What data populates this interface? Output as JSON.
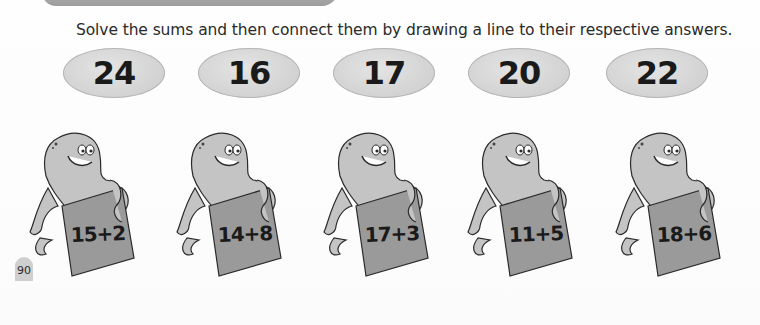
{
  "header": {
    "banner_color": "#a8a8a8"
  },
  "instruction": "Solve the sums and then connect them by drawing a line to their respective answers.",
  "answers": [
    {
      "value": "24"
    },
    {
      "value": "16"
    },
    {
      "value": "17"
    },
    {
      "value": "20"
    },
    {
      "value": "22"
    }
  ],
  "sums": [
    {
      "expression": "15+2",
      "icon": "octopus-icon"
    },
    {
      "expression": "14+8",
      "icon": "octopus-icon"
    },
    {
      "expression": "17+3",
      "icon": "octopus-icon"
    },
    {
      "expression": "11+5",
      "icon": "octopus-icon"
    },
    {
      "expression": "18+6",
      "icon": "octopus-icon"
    }
  ],
  "footer": {
    "page_number": "90"
  },
  "colors": {
    "oval_fill": "#d6d6d6",
    "octopus_body": "#c4c4c4",
    "sign_fill": "#9a9a9a",
    "text": "#1a1a1a"
  }
}
